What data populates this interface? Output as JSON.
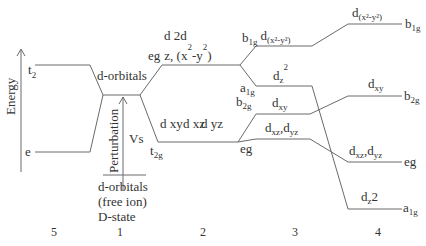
{
  "axis": {
    "label": "Energy"
  },
  "columns": [
    {
      "number": "5",
      "levels": [
        {
          "label": "t",
          "sub": "2"
        },
        {
          "label": "e",
          "sub": ""
        }
      ]
    },
    {
      "number": "1",
      "center_label": "d-orbitals",
      "perturbation_label": "Perturbation",
      "vs_label": "Vs",
      "free_ion": [
        "d-orbitals",
        "(free ion)",
        "D-state"
      ]
    },
    {
      "number": "2",
      "eg": {
        "label": "eg",
        "orbitals_top": "d 2d",
        "orbitals": "z, (x",
        "sup1": "2",
        "mid": "-y",
        "sup2": "2",
        "close": ")"
      },
      "t2g": {
        "label": "t",
        "sub": "2g",
        "orbitals": [
          "d xy",
          "d xz",
          "d yz"
        ]
      }
    },
    {
      "number": "3",
      "levels": [
        {
          "sym": "b",
          "sym_sub": "1g",
          "orb": "d",
          "orb_sub": "(x²-y²)"
        },
        {
          "sym": "a",
          "sym_sub": "1g",
          "orb": "d",
          "orb_sub": "z",
          "orb_sup": "2"
        },
        {
          "sym": "b",
          "sym_sub": "2g",
          "orb": "d",
          "orb_sub": "xy"
        },
        {
          "sym": "eg",
          "sym_sub": "",
          "orb": "d",
          "orb_sub": "xz",
          "orb2": ",d",
          "orb2_sub": "yz"
        }
      ]
    },
    {
      "number": "4",
      "levels": [
        {
          "sym": "b",
          "sym_sub": "1g",
          "orb": "d",
          "orb_sub": "(x²-y²)"
        },
        {
          "sym": "b",
          "sym_sub": "2g",
          "orb": "d",
          "orb_sub": "xy"
        },
        {
          "sym": "eg",
          "sym_sub": "",
          "orb": "d",
          "orb_sub": "xz",
          "orb2": ",d",
          "orb2_sub": "yz"
        },
        {
          "sym": "a",
          "sym_sub": "1g",
          "orb": "d",
          "orb_sub": "z",
          "orb_tail": "2"
        }
      ]
    }
  ]
}
